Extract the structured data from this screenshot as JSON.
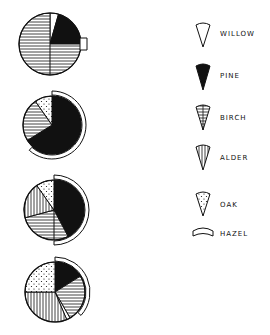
{
  "legend": {
    "items": [
      {
        "key": "willow",
        "label": "WILLOW",
        "pattern": "white"
      },
      {
        "key": "pine",
        "label": "PINE",
        "pattern": "black"
      },
      {
        "key": "birch",
        "label": "BIRCH",
        "pattern": "horizontal-lines"
      },
      {
        "key": "alder",
        "label": "ALDER",
        "pattern": "vertical-lines"
      },
      {
        "key": "oak",
        "label": "OAK",
        "pattern": "dots"
      },
      {
        "key": "hazel",
        "label": "HAZEL",
        "pattern": "outer-arc"
      }
    ]
  },
  "chart_data": {
    "type": "pie",
    "title": "",
    "legend_position": "right",
    "charts": [
      {
        "center": [
          50,
          44
        ],
        "radius": 31,
        "slices": [
          {
            "taxon": "willow",
            "start": 0,
            "end": 16
          },
          {
            "taxon": "pine",
            "start": 16,
            "end": 90
          },
          {
            "taxon": "birch",
            "start": 90,
            "end": 360
          }
        ],
        "dividers": [
          180
        ],
        "hazel_arc": {
          "start": 84,
          "end": 96,
          "style": "box"
        }
      },
      {
        "center": [
          52,
          125
        ],
        "radius": 29,
        "slices": [
          {
            "taxon": "pine",
            "start": 0,
            "end": 238
          },
          {
            "taxon": "birch",
            "start": 238,
            "end": 325
          },
          {
            "taxon": "oak",
            "start": 325,
            "end": 360
          }
        ],
        "dividers": [],
        "hazel_arc": {
          "start": 0,
          "end": 222,
          "style": "arc"
        }
      },
      {
        "center": [
          54,
          210
        ],
        "radius": 30,
        "slices": [
          {
            "taxon": "pine",
            "start": 0,
            "end": 152
          },
          {
            "taxon": "birch",
            "start": 152,
            "end": 255
          },
          {
            "taxon": "alder",
            "start": 255,
            "end": 325
          },
          {
            "taxon": "oak",
            "start": 325,
            "end": 360
          }
        ],
        "dividers": [
          180
        ],
        "hazel_arc": {
          "start": 0,
          "end": 180,
          "style": "arc"
        }
      },
      {
        "center": [
          55,
          292
        ],
        "radius": 30,
        "slices": [
          {
            "taxon": "pine",
            "start": 0,
            "end": 58
          },
          {
            "taxon": "birch",
            "start": 58,
            "end": 150
          },
          {
            "taxon": "willow",
            "start": 150,
            "end": 157
          },
          {
            "taxon": "alder",
            "start": 157,
            "end": 270
          },
          {
            "taxon": "oak",
            "start": 270,
            "end": 360
          }
        ],
        "dividers": [],
        "hazel_arc": {
          "start": 0,
          "end": 132,
          "style": "arc"
        }
      }
    ]
  }
}
